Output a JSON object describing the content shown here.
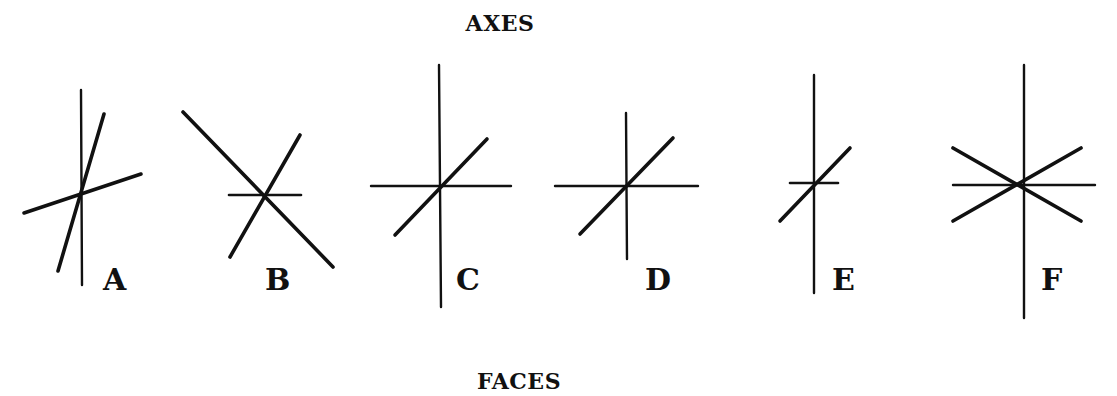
{
  "title": "AXES",
  "footer": "FACES",
  "colors": {
    "stroke": "#111111",
    "background": "#ffffff"
  },
  "figures": [
    {
      "label": "A",
      "description": "three axes: vertical, steep oblique, shallow oblique",
      "label_pos": [
        103,
        290
      ],
      "lines": [
        {
          "x1": 81,
          "y1": 90,
          "x2": 82,
          "y2": 285,
          "w": 2.4
        },
        {
          "x1": 104,
          "y1": 114,
          "x2": 58,
          "y2": 271,
          "w": 3.6
        },
        {
          "x1": 24,
          "y1": 213,
          "x2": 141,
          "y2": 174,
          "w": 3.6
        }
      ]
    },
    {
      "label": "B",
      "description": "two oblique axes and a short horizontal",
      "label_pos": [
        265,
        290
      ],
      "lines": [
        {
          "x1": 183,
          "y1": 112,
          "x2": 333,
          "y2": 267,
          "w": 3.6
        },
        {
          "x1": 300,
          "y1": 135,
          "x2": 230,
          "y2": 257,
          "w": 3.6
        },
        {
          "x1": 229,
          "y1": 195,
          "x2": 301,
          "y2": 195,
          "w": 2.6
        }
      ]
    },
    {
      "label": "C",
      "description": "long vertical, horizontal and a 45-degree diagonal",
      "label_pos": [
        456,
        290
      ],
      "lines": [
        {
          "x1": 439,
          "y1": 65,
          "x2": 441,
          "y2": 307,
          "w": 2.4
        },
        {
          "x1": 371,
          "y1": 186,
          "x2": 511,
          "y2": 186,
          "w": 2.4
        },
        {
          "x1": 395,
          "y1": 235,
          "x2": 487,
          "y2": 139,
          "w": 3.6
        }
      ]
    },
    {
      "label": "D",
      "description": "shorter vertical, horizontal and a 45-degree diagonal",
      "label_pos": [
        645,
        290
      ],
      "lines": [
        {
          "x1": 626,
          "y1": 113,
          "x2": 627,
          "y2": 259,
          "w": 2.4
        },
        {
          "x1": 555,
          "y1": 186,
          "x2": 698,
          "y2": 186,
          "w": 2.4
        },
        {
          "x1": 580,
          "y1": 234,
          "x2": 673,
          "y2": 138,
          "w": 3.6
        }
      ]
    },
    {
      "label": "E",
      "description": "long vertical, short horizontal and short diagonal",
      "label_pos": [
        832,
        290
      ],
      "lines": [
        {
          "x1": 814,
          "y1": 75,
          "x2": 814,
          "y2": 293,
          "w": 2.4
        },
        {
          "x1": 790,
          "y1": 183,
          "x2": 838,
          "y2": 183,
          "w": 2.6
        },
        {
          "x1": 780,
          "y1": 221,
          "x2": 850,
          "y2": 148,
          "w": 3.6
        }
      ]
    },
    {
      "label": "F",
      "description": "vertical, horizontal and two symmetric oblique axes",
      "label_pos": [
        1041,
        290
      ],
      "lines": [
        {
          "x1": 1024,
          "y1": 65,
          "x2": 1024,
          "y2": 318,
          "w": 2.4
        },
        {
          "x1": 953,
          "y1": 185,
          "x2": 1095,
          "y2": 185,
          "w": 2.4
        },
        {
          "x1": 953,
          "y1": 148,
          "x2": 1081,
          "y2": 221,
          "w": 3.6
        },
        {
          "x1": 953,
          "y1": 221,
          "x2": 1081,
          "y2": 148,
          "w": 3.6
        }
      ]
    }
  ]
}
